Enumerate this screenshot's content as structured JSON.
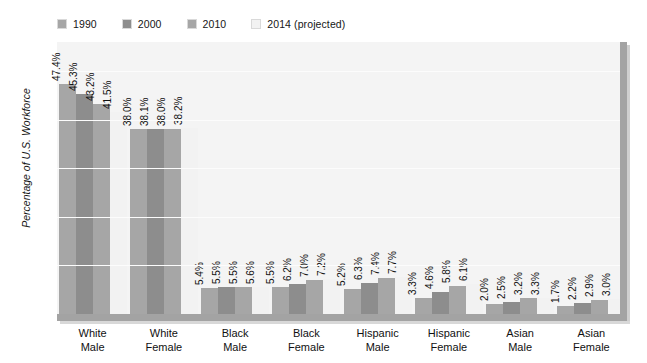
{
  "chart_data": {
    "type": "bar",
    "title": "",
    "xlabel": "",
    "ylabel": "Percentage of U.S. Workforce",
    "ylim": [
      0,
      56
    ],
    "yticks": [
      10,
      20,
      30,
      40,
      50
    ],
    "ytick_labels": [
      "10",
      "20",
      "30",
      "40",
      "50"
    ],
    "grid": true,
    "legend_position": "top-left",
    "categories": [
      "White Male",
      "White Female",
      "Black Male",
      "Black Female",
      "Hispanic Male",
      "Hispanic Female",
      "Asian Male",
      "Asian Female"
    ],
    "category_lines": [
      [
        "White",
        "Male"
      ],
      [
        "White",
        "Female"
      ],
      [
        "Black",
        "Male"
      ],
      [
        "Black",
        "Female"
      ],
      [
        "Hispanic",
        "Male"
      ],
      [
        "Hispanic",
        "Female"
      ],
      [
        "Asian",
        "Male"
      ],
      [
        "Asian",
        "Female"
      ]
    ],
    "series": [
      {
        "name": "1990",
        "color": "#a6a6a6",
        "values": [
          47.4,
          38.0,
          5.4,
          5.5,
          5.2,
          3.3,
          2.0,
          1.7
        ],
        "labels": [
          "47.4%",
          "38.0%",
          "5.4%",
          "5.5%",
          "5.2%",
          "3.3%",
          "2.0%",
          "1.7%"
        ]
      },
      {
        "name": "2000",
        "color": "#8d8d8d",
        "values": [
          45.3,
          38.1,
          5.5,
          6.2,
          6.3,
          4.6,
          2.5,
          2.2
        ],
        "labels": [
          "45.3%",
          "38.1%",
          "5.5%",
          "6.2%",
          "6.3%",
          "4.6%",
          "2.5%",
          "2.2%"
        ]
      },
      {
        "name": "2010",
        "color": "#a6a6a6",
        "values": [
          43.2,
          38.0,
          5.5,
          7.0,
          7.4,
          5.8,
          3.2,
          2.9
        ],
        "labels": [
          "43.2%",
          "38.0%",
          "5.5%",
          "7.0%",
          "7.4%",
          "5.8%",
          "3.2%",
          "2.9%"
        ]
      },
      {
        "name": "2014 (projected)",
        "color": "#f2f2f2",
        "values": [
          41.5,
          38.2,
          5.6,
          7.2,
          7.7,
          6.1,
          3.3,
          3.0
        ],
        "labels": [
          "41.5%",
          "38.2%",
          "5.6%",
          "7.2%",
          "7.7%",
          "6.1%",
          "3.3%",
          "3.0%"
        ]
      }
    ]
  },
  "legend": {
    "items": [
      {
        "label": "1990",
        "color": "#a6a6a6"
      },
      {
        "label": "2000",
        "color": "#8d8d8d"
      },
      {
        "label": "2010",
        "color": "#a6a6a6"
      },
      {
        "label": "2014 (projected)",
        "color": "#f2f2f2"
      }
    ]
  },
  "axes": {
    "y_title": "Percentage of U.S. Workforce"
  }
}
